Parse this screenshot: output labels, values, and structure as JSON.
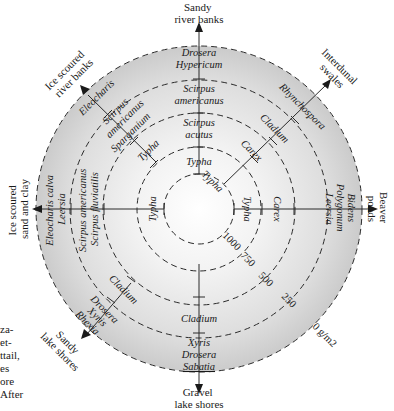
{
  "diagram": {
    "center": {
      "x": 199,
      "y": 209
    },
    "colors": {
      "outer_band": "#cfcfcf",
      "mid_band": "#dedede",
      "inner_fill": "#f6f6f6",
      "line": "#2a2a2a",
      "text": "#1a1a1a"
    },
    "rings": [
      {
        "radius": 163,
        "label": "0 g/m2"
      },
      {
        "radius": 129,
        "label": "250"
      },
      {
        "radius": 96,
        "label": "500"
      },
      {
        "radius": 62,
        "label": "750"
      },
      {
        "radius": 35,
        "label": "1000"
      }
    ],
    "habitats": {
      "n": [
        "Sandy",
        "river banks"
      ],
      "ne": [
        "Interdunal",
        "swales"
      ],
      "e": [
        "Beaver",
        "ponds"
      ],
      "se_unit": "0 g/m2",
      "s": [
        "Gravel",
        "lake shores"
      ],
      "sw": [
        "Sandy",
        "lake shores"
      ],
      "w": [
        "Ice scoured",
        "sand and clay"
      ],
      "nw": [
        "Ice scoured",
        "river banks"
      ]
    },
    "species": {
      "n": {
        "band0": [
          "Drosera",
          "Hypericum"
        ],
        "band1": [
          "Scirpus",
          "americanus"
        ],
        "band2": [
          "Scirpus",
          "acutus"
        ],
        "band3": [
          "Typha"
        ]
      },
      "ne": {
        "band0": [
          "Rhynchospora"
        ],
        "band1": [
          "Cladium"
        ],
        "band2": [
          "Carex"
        ],
        "band4": [
          "Typha"
        ]
      },
      "e": {
        "band0": [
          "Bidens",
          "Polygonum",
          "Leersia"
        ],
        "band2": [
          "Carex"
        ],
        "band3": [
          "Typha"
        ]
      },
      "s": {
        "band0": [
          "Xyris",
          "Drosera",
          "Sabatia"
        ],
        "band1": [
          "Cladium"
        ]
      },
      "sw": {
        "band0": [
          "Xyris",
          "Rhexia"
        ],
        "band0b": [
          "Drosera"
        ],
        "band1": [
          "Cladium"
        ]
      },
      "w": {
        "band0": [
          "Eleocharis calva",
          "Leersia"
        ],
        "band1": [
          "Scirpus americanus",
          "Scirpus fluviatilis"
        ],
        "band3": [
          "Typha"
        ]
      },
      "nw": {
        "band0": [
          "Eleocharis"
        ],
        "band1": [
          "Scirpus",
          "americanus"
        ],
        "band1b": [
          "Sparganium"
        ],
        "band2": [
          "Typha"
        ]
      }
    },
    "caption_fragments": [
      "za-",
      "et-",
      "ttail,",
      "es",
      "ore",
      "After"
    ]
  }
}
